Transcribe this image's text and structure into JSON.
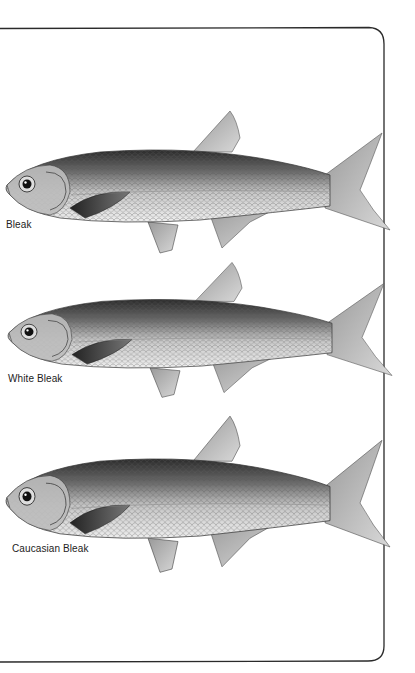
{
  "page": {
    "frame": {
      "stroke": "#2a2a2a"
    },
    "fish": [
      {
        "name": "Bleak",
        "label": "Bleak"
      },
      {
        "name": "White Bleak",
        "label": "White Bleak"
      },
      {
        "name": "Caucasian Bleak",
        "label": "Caucasian Bleak"
      }
    ]
  }
}
